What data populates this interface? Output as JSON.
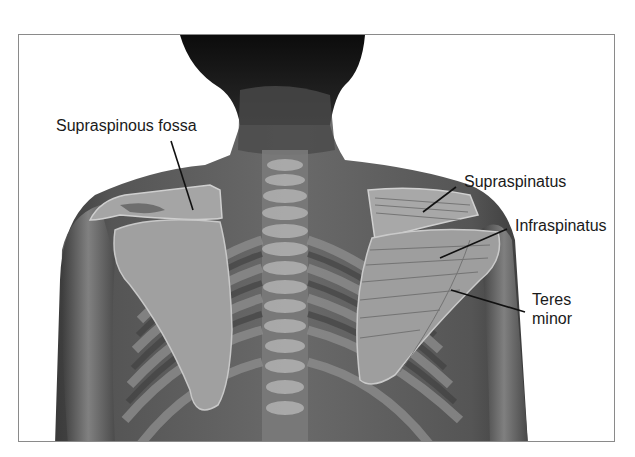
{
  "figure": {
    "labels": [
      {
        "id": "supraspinous-fossa",
        "text": "Supraspinous fossa",
        "x": 56,
        "y": 116,
        "line": [
          171,
          141,
          193,
          210
        ]
      },
      {
        "id": "supraspinatus",
        "text": "Supraspinatus",
        "x": 464,
        "y": 172,
        "line": [
          456,
          187,
          423,
          212
        ]
      },
      {
        "id": "infraspinatus",
        "text": "Infraspinatus",
        "x": 515,
        "y": 216,
        "line": [
          507,
          229,
          440,
          258
        ]
      },
      {
        "id": "teres-minor",
        "text": "Teres\nminor",
        "x": 532,
        "y": 290,
        "line": [
          451,
          290,
          525,
          312
        ]
      }
    ]
  },
  "colors": {
    "background": "#ffffff",
    "frame": "#8a8a8a",
    "skin_dark": "#2e2e2e",
    "skin_mid": "#5c5c5c",
    "bone": "#a9a9a9",
    "muscle": "#9a9a9a",
    "label_text": "#1a1a1a",
    "leader_line": "#111111"
  }
}
